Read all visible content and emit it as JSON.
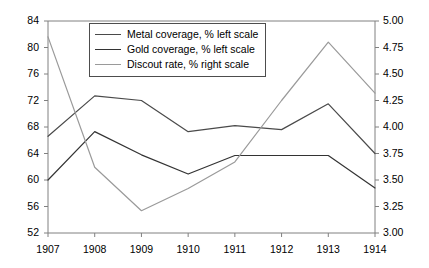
{
  "chart_data": {
    "type": "line",
    "title": "",
    "xlabel": "",
    "ylabel": "",
    "categories": [
      "1907",
      "1908",
      "1909",
      "1910",
      "1911",
      "1912",
      "1913",
      "1914"
    ],
    "x": [
      1907,
      1908,
      1909,
      1910,
      1911,
      1912,
      1913,
      1914
    ],
    "grid": false,
    "legend_position": "top-center-inside",
    "axes": {
      "left": {
        "label": "",
        "min": 52,
        "max": 84,
        "step": 4,
        "ticks": [
          "52",
          "56",
          "60",
          "64",
          "68",
          "72",
          "76",
          "80",
          "84"
        ],
        "tick_values": [
          52,
          56,
          60,
          64,
          68,
          72,
          76,
          80,
          84
        ]
      },
      "right": {
        "label": "",
        "min": 3.0,
        "max": 5.0,
        "step": 0.25,
        "ticks": [
          "3.00",
          "3.25",
          "3.50",
          "3.75",
          "4.00",
          "4.25",
          "4.50",
          "4.75",
          "5.00"
        ],
        "tick_values": [
          3.0,
          3.25,
          3.5,
          3.75,
          4.0,
          4.25,
          4.5,
          4.75,
          5.0
        ]
      },
      "x": {
        "min": 1907,
        "max": 1914
      }
    },
    "series": [
      {
        "name": "Metal coverage, % left scale",
        "axis": "left",
        "color": "#4a4a4a",
        "values": [
          66.6,
          72.7,
          72.0,
          67.3,
          68.2,
          67.6,
          71.5,
          64.0
        ]
      },
      {
        "name": "Gold coverage, % left scale",
        "axis": "left",
        "color": "#333333",
        "values": [
          60.0,
          67.3,
          63.8,
          60.9,
          63.7,
          63.7,
          63.7,
          58.8
        ]
      },
      {
        "name": "Discout rate, % right scale",
        "axis": "right",
        "color": "#9a9a9a",
        "values": [
          4.85,
          3.62,
          3.21,
          3.42,
          3.67,
          4.25,
          4.8,
          4.32
        ]
      }
    ]
  },
  "legend": {
    "entries": [
      {
        "label": "Metal coverage, % left scale"
      },
      {
        "label": "Gold coverage, % left scale"
      },
      {
        "label": "Discout rate, % right scale"
      }
    ]
  }
}
